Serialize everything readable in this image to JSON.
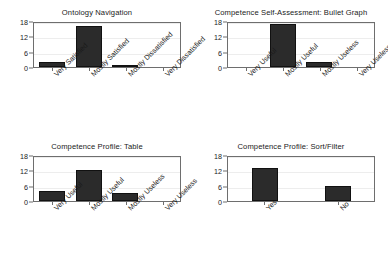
{
  "figure": {
    "background": "#ffffff",
    "bar_color": "#2b2b2b",
    "axis_color": "#6e6e6e",
    "grid_color": "#ededed",
    "rows": 2,
    "cols": 2
  },
  "chart_data": [
    {
      "type": "bar",
      "title": "Ontology Navigation",
      "categories": [
        "Very Satisfied",
        "Mostly Satisfied",
        "Mostly Dissatisfied",
        "Very Dissatisfied"
      ],
      "values": [
        2,
        16,
        0.7,
        0
      ],
      "xlabel": "",
      "ylabel": "",
      "ylim": [
        0,
        18
      ],
      "yticks": [
        0,
        6,
        12,
        18
      ],
      "grid": true,
      "legend": "none"
    },
    {
      "type": "bar",
      "title": "Competence Self-Assessment: Bullet Graph",
      "categories": [
        "Very Useful",
        "Mostly Useful",
        "Mostly Useless",
        "Very Useless"
      ],
      "values": [
        0,
        17,
        2,
        0
      ],
      "xlabel": "",
      "ylabel": "",
      "ylim": [
        0,
        18
      ],
      "yticks": [
        0,
        6,
        12,
        18
      ],
      "grid": true,
      "legend": "none"
    },
    {
      "type": "bar",
      "title": "Competence Profile: Table",
      "categories": [
        "Very Useful",
        "Mostly Useful",
        "Mostly Useless",
        "Very Useless"
      ],
      "values": [
        4,
        12,
        3,
        0
      ],
      "xlabel": "",
      "ylabel": "",
      "ylim": [
        0,
        18
      ],
      "yticks": [
        0,
        6,
        12,
        18
      ],
      "grid": true,
      "legend": "none"
    },
    {
      "type": "bar",
      "title": "Competence Profile: Sort/Filter",
      "categories": [
        "Yes",
        "No"
      ],
      "values": [
        13,
        6
      ],
      "xlabel": "",
      "ylabel": "",
      "ylim": [
        0,
        18
      ],
      "yticks": [
        0,
        6,
        12,
        18
      ],
      "grid": true,
      "legend": "none"
    }
  ]
}
